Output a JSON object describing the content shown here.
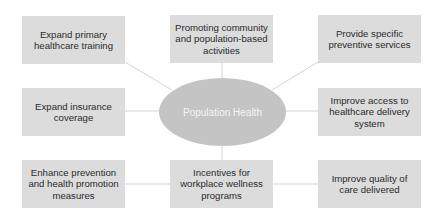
{
  "diagram": {
    "center": {
      "label": "Population Health"
    },
    "nodes": [
      {
        "id": "top-left",
        "label": "Expand primary healthcare training"
      },
      {
        "id": "top-center",
        "label": "Promoting community and population-based activities"
      },
      {
        "id": "top-right",
        "label": "Provide specific preventive services"
      },
      {
        "id": "middle-left",
        "label": "Expand insurance coverage"
      },
      {
        "id": "middle-right",
        "label": "Improve access to healthcare delivery system"
      },
      {
        "id": "bottom-left",
        "label": "Enhance prevention and health promotion measures"
      },
      {
        "id": "bottom-center",
        "label": "Incentives for workplace wellness programs"
      },
      {
        "id": "bottom-right",
        "label": "Improve quality of care delivered"
      }
    ],
    "colors": {
      "box_fill": "#dcdcdc",
      "ellipse_fill": "#c4c4c4",
      "connector": "#c8c8c8",
      "text": "#2b2b2b",
      "center_text": "#f4f4f4"
    }
  }
}
